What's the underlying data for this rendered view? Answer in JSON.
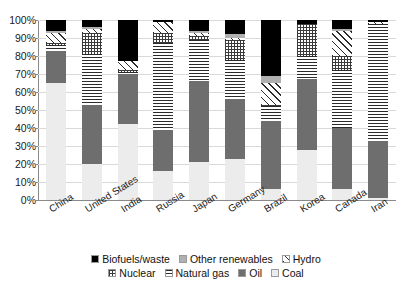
{
  "chart_data": {
    "type": "bar",
    "subtype": "stacked-percent",
    "title": "",
    "xlabel": "",
    "ylabel": "",
    "ylim": [
      0,
      100
    ],
    "ytick_labels": [
      "0%",
      "10%",
      "20%",
      "30%",
      "40%",
      "50%",
      "60%",
      "70%",
      "80%",
      "90%",
      "100%"
    ],
    "ytick_values": [
      0,
      10,
      20,
      30,
      40,
      50,
      60,
      70,
      80,
      90,
      100
    ],
    "grid": true,
    "legend_position": "bottom",
    "categories": [
      "China",
      "United States",
      "India",
      "Russia",
      "Japan",
      "Germany",
      "Brazil",
      "Korea",
      "Canada",
      "Iran"
    ],
    "series": [
      {
        "name": "Coal",
        "pattern": "solid-light-gray",
        "color": "#ececec",
        "values": [
          65,
          20,
          42,
          16,
          21,
          23,
          6,
          28,
          6,
          1
        ]
      },
      {
        "name": "Oil",
        "pattern": "solid-dark-gray",
        "color": "#6e6e6e",
        "values": [
          18,
          33,
          28,
          23,
          45,
          33,
          38,
          39,
          34,
          32
        ]
      },
      {
        "name": "Natural gas",
        "pattern": "horizontal-lines",
        "color": "#2b2b2b",
        "values": [
          3,
          28,
          1,
          48,
          23,
          22,
          8,
          13,
          32,
          65
        ]
      },
      {
        "name": "Nuclear",
        "pattern": "cross-hatch-grid",
        "color": "#3a3a3a",
        "values": [
          1,
          12,
          1,
          6,
          2,
          11,
          1,
          18,
          8,
          0
        ]
      },
      {
        "name": "Hydro",
        "pattern": "diagonal-hatch",
        "color": "#2b2b2b",
        "values": [
          6,
          2,
          5,
          6,
          2,
          1,
          12,
          0,
          14,
          1
        ]
      },
      {
        "name": "Other renewables",
        "pattern": "solid-mid-gray",
        "color": "#b0b0b0",
        "values": [
          1,
          1,
          0,
          0,
          1,
          2,
          4,
          0,
          1,
          0
        ]
      },
      {
        "name": "Biofuels/waste",
        "pattern": "solid-black",
        "color": "#000000",
        "values": [
          6,
          4,
          23,
          1,
          6,
          8,
          31,
          2,
          5,
          1
        ]
      }
    ]
  },
  "legend": {
    "row1": [
      {
        "label": "Biofuels/waste",
        "swatch": "solid-black-swatch"
      },
      {
        "label": "Other renewables",
        "swatch": "solid-mid-gray-swatch"
      },
      {
        "label": "Hydro",
        "swatch": "diagonal-hatch-swatch"
      }
    ],
    "row2": [
      {
        "label": "Nuclear",
        "swatch": "cross-hatch-swatch"
      },
      {
        "label": "Natural gas",
        "swatch": "horizontal-lines-swatch"
      },
      {
        "label": "Oil",
        "swatch": "solid-dark-gray-swatch"
      },
      {
        "label": "Coal",
        "swatch": "solid-light-gray-swatch"
      }
    ]
  }
}
